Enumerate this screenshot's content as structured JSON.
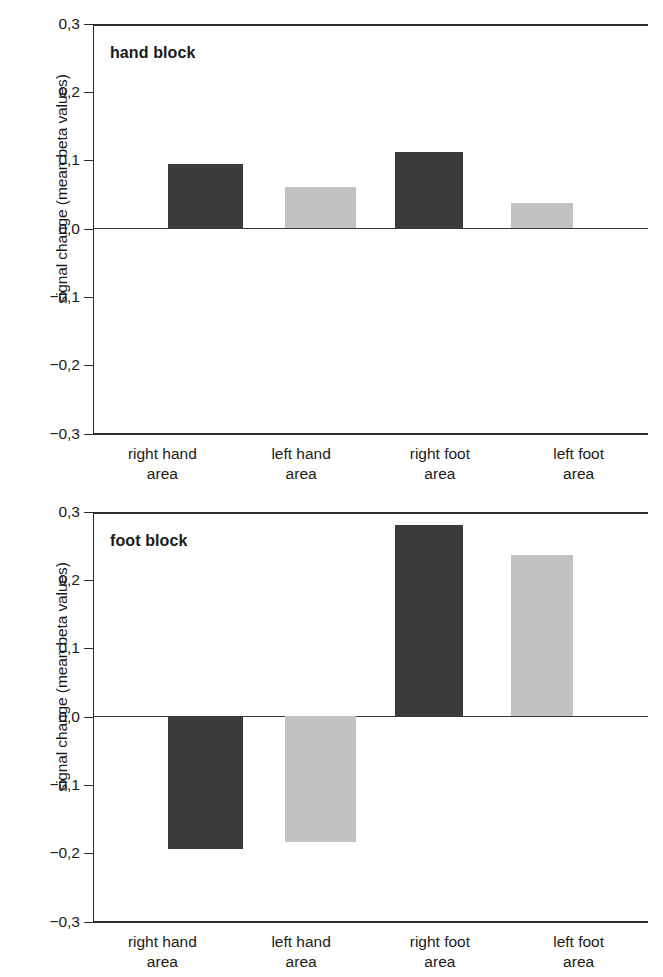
{
  "figure": {
    "background": "#ffffff",
    "axis_color": "#2b2b2b",
    "dark_bar_color": "#3b3b3b",
    "light_bar_color": "#c2c2c2"
  },
  "panels": [
    {
      "key": "hand",
      "title": "hand block",
      "ylabel": "signal change (mean beta values)",
      "yticks": [
        "0,3",
        "0,2",
        "0,1",
        "0,0",
        "−0,1",
        "−0,2",
        "−0,3"
      ],
      "categories": [
        {
          "line1": "right hand",
          "line2": "area"
        },
        {
          "line1": "left hand",
          "line2": "area"
        },
        {
          "line1": "right foot",
          "line2": "area"
        },
        {
          "line1": "left foot",
          "line2": "area"
        }
      ]
    },
    {
      "key": "foot",
      "title": "foot block",
      "ylabel": "signal change (mean beta values)",
      "yticks": [
        "0,3",
        "0,2",
        "0,1",
        "0,0",
        "−0,1",
        "−0,2",
        "−0,3"
      ],
      "categories": [
        {
          "line1": "right hand",
          "line2": "area"
        },
        {
          "line1": "left hand",
          "line2": "area"
        },
        {
          "line1": "right foot",
          "line2": "area"
        },
        {
          "line1": "left foot",
          "line2": "area"
        }
      ]
    }
  ],
  "chart_data": [
    {
      "type": "bar",
      "title": "hand block",
      "xlabel": "",
      "ylabel": "signal change (mean beta values)",
      "categories": [
        "right hand area",
        "left hand area",
        "right foot area",
        "left foot area"
      ],
      "values": [
        0.093,
        0.06,
        0.111,
        0.037
      ],
      "bar_colors": [
        "#3b3b3b",
        "#c2c2c2",
        "#3b3b3b",
        "#c2c2c2"
      ],
      "ylim": [
        -0.3,
        0.3
      ],
      "yticks": [
        0.3,
        0.2,
        0.1,
        0.0,
        -0.1,
        -0.2,
        -0.3
      ],
      "ytick_labels": [
        "0,3",
        "0,2",
        "0,1",
        "0,0",
        "−0,1",
        "−0,2",
        "−0,3"
      ],
      "grid": false,
      "legend": "none",
      "zero_line": true
    },
    {
      "type": "bar",
      "title": "foot block",
      "xlabel": "",
      "ylabel": "signal change (mean beta values)",
      "categories": [
        "right hand area",
        "left hand area",
        "right foot area",
        "left foot area"
      ],
      "values": [
        -0.195,
        -0.185,
        0.28,
        0.235
      ],
      "bar_colors": [
        "#3b3b3b",
        "#c2c2c2",
        "#3b3b3b",
        "#c2c2c2"
      ],
      "ylim": [
        -0.3,
        0.3
      ],
      "yticks": [
        0.3,
        0.2,
        0.1,
        0.0,
        -0.1,
        -0.2,
        -0.3
      ],
      "ytick_labels": [
        "0,3",
        "0,2",
        "0,1",
        "0,0",
        "−0,1",
        "−0,2",
        "−0,3"
      ],
      "grid": false,
      "legend": "none",
      "zero_line": true
    }
  ]
}
